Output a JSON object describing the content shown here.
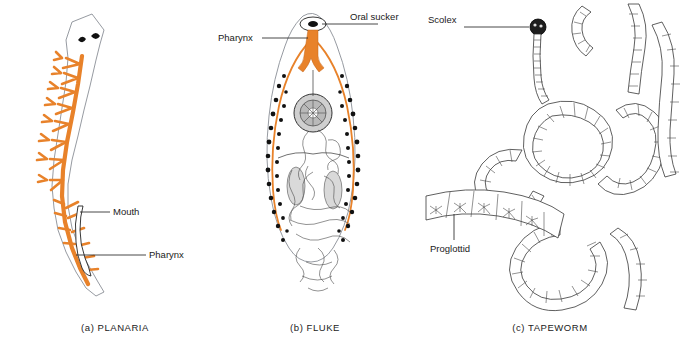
{
  "figure": {
    "background": "#ffffff",
    "accent_color": "#E8822A",
    "ink_color": "#1a1a1a",
    "outline_color": "#8a8f96"
  },
  "panels": [
    {
      "id": "planaria",
      "caption": "(a) PLANARIA",
      "organism": "planaria",
      "labels": [
        {
          "text": "Mouth",
          "name": "label-mouth"
        },
        {
          "text": "Pharynx",
          "name": "label-pharynx"
        }
      ],
      "features": [
        "eyespot",
        "eyespot",
        "branched-gut",
        "protruding-pharynx",
        "triangular-head"
      ]
    },
    {
      "id": "fluke",
      "caption": "(b) FLUKE",
      "organism": "fluke",
      "labels": [
        {
          "text": "Pharynx",
          "name": "label-pharynx"
        },
        {
          "text": "Oral sucker",
          "name": "label-oral-sucker"
        }
      ],
      "features": [
        "oral-sucker",
        "pharynx",
        "ventral-sucker",
        "intestinal-ceca",
        "vitellaria",
        "testis",
        "testis",
        "uterus-coils"
      ]
    },
    {
      "id": "tapeworm",
      "caption": "(c) TAPEWORM",
      "organism": "tapeworm",
      "labels": [
        {
          "text": "Scolex",
          "name": "label-scolex"
        },
        {
          "text": "Proglottid",
          "name": "label-proglottid"
        }
      ],
      "features": [
        "scolex",
        "neck",
        "proglottid-chain",
        "mature-proglottid-strip"
      ]
    }
  ]
}
